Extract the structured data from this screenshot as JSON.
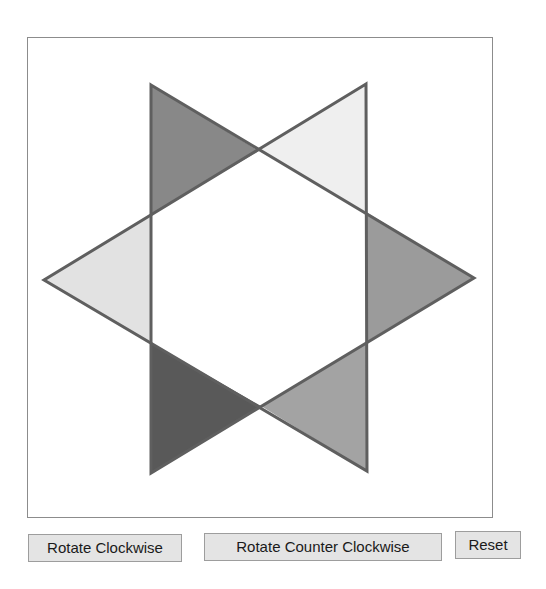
{
  "canvas": {
    "frame_color": "#8c8c8c",
    "stroke_color": "#5f5f5f",
    "center_fill": "#ffffff",
    "triangles": [
      {
        "name": "right-pointing-triangle",
        "points": "151,85 474,278 151,473"
      },
      {
        "name": "left-pointing-triangle",
        "points": "366,84 44,280 367,471"
      }
    ],
    "segments": [
      {
        "name": "top-left-tip",
        "points": "151,85 259,151 151,214",
        "fill": "#888888"
      },
      {
        "name": "top-right-tip",
        "points": "366,84 259,151 366,212",
        "fill": "#efefef"
      },
      {
        "name": "right-tip",
        "points": "366,212 474,278 366,342",
        "fill": "#9b9b9b"
      },
      {
        "name": "bottom-right-tip",
        "points": "367,342 261,406 367,471",
        "fill": "#a3a3a3"
      },
      {
        "name": "bottom-left-tip",
        "points": "151,343 261,406 151,473",
        "fill": "#595959"
      },
      {
        "name": "left-tip",
        "points": "151,214 44,280 151,343",
        "fill": "#e2e2e2"
      }
    ]
  },
  "controls": {
    "rotate_cw_label": "Rotate Clockwise",
    "rotate_ccw_label": "Rotate Counter Clockwise",
    "reset_label": "Reset"
  }
}
